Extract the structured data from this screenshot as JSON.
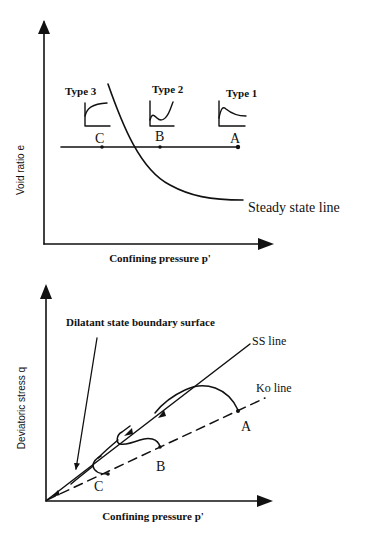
{
  "top_diagram": {
    "y_axis_label": "Void ratio e",
    "x_axis_label": "Confining pressure p'",
    "curve_label": "Steady state line",
    "types": [
      {
        "label": "Type 3",
        "point": "C",
        "shape": "strain-hardening"
      },
      {
        "label": "Type 2",
        "point": "B",
        "shape": "limited-softening-then-hardening"
      },
      {
        "label": "Type 1",
        "point": "A",
        "shape": "strain-softening"
      }
    ]
  },
  "bottom_diagram": {
    "y_axis_label": "Deviatoric stress q",
    "x_axis_label": "Confining pressure p'",
    "annotation": "Dilatant state boundary surface",
    "ss_line_label": "SS line",
    "ko_line_label": "Ko line",
    "points": [
      "A",
      "B",
      "C"
    ]
  },
  "colors": {
    "ink": "#111111",
    "background": "#ffffff"
  }
}
